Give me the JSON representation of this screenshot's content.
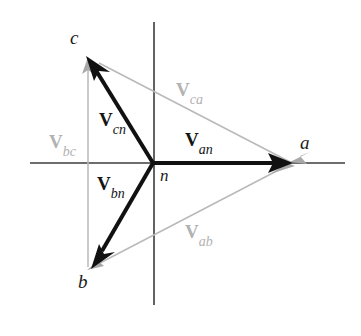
{
  "figure": {
    "width": 361,
    "height": 336,
    "background": "#ffffff"
  },
  "colors": {
    "axis": "#3c3c3c",
    "phase_vector": "#111111",
    "line_vector": "#b2b2b2",
    "vertex_text": "#1a1a1a",
    "faint_text": "#b2b2b2"
  },
  "geometry": {
    "origin": {
      "x": 153,
      "y": 163,
      "label": "n"
    },
    "axes": {
      "horizontal": {
        "x1": 30,
        "y1": 163,
        "x2": 345,
        "y2": 163
      },
      "vertical": {
        "x1": 154,
        "y1": 22,
        "x2": 154,
        "y2": 305
      }
    },
    "vertices": [
      {
        "name": "a",
        "x": 292,
        "y": 163
      },
      {
        "name": "b",
        "x": 92,
        "y": 267
      },
      {
        "name": "c",
        "x": 88,
        "y": 58
      }
    ]
  },
  "vertex_labels": [
    {
      "name": "a",
      "text": "a",
      "x": 300,
      "y": 133
    },
    {
      "name": "b",
      "text": "b",
      "x": 78,
      "y": 272
    },
    {
      "name": "c",
      "text": "c",
      "x": 70,
      "y": 28
    },
    {
      "name": "n",
      "text": "n",
      "x": 160,
      "y": 167
    }
  ],
  "phase_vectors": [
    {
      "name": "V_an",
      "symbol": "V",
      "subscript": "an",
      "from": "n",
      "to": "a",
      "x1": 153,
      "y1": 163,
      "x2": 292,
      "y2": 163,
      "style": "dark",
      "label_x": 185,
      "label_y": 130
    },
    {
      "name": "V_bn",
      "symbol": "V",
      "subscript": "bn",
      "from": "n",
      "to": "b",
      "x1": 153,
      "y1": 163,
      "x2": 92,
      "y2": 267,
      "style": "dark",
      "label_x": 97,
      "label_y": 174
    },
    {
      "name": "V_cn",
      "symbol": "V",
      "subscript": "cn",
      "from": "n",
      "to": "c",
      "x1": 153,
      "y1": 163,
      "x2": 88,
      "y2": 58,
      "style": "dark",
      "label_x": 99,
      "label_y": 110
    }
  ],
  "line_vectors": [
    {
      "name": "V_ab",
      "symbol": "V",
      "subscript": "ab",
      "from": "a",
      "to": "b",
      "x1": 292,
      "y1": 163,
      "x2": 92,
      "y2": 267,
      "style": "faint",
      "label_x": 185,
      "label_y": 222
    },
    {
      "name": "V_bc",
      "symbol": "V",
      "subscript": "bc",
      "from": "b",
      "to": "c",
      "x1": 88,
      "y1": 267,
      "x2": 88,
      "y2": 58,
      "style": "faint",
      "label_x": 49,
      "label_y": 132
    },
    {
      "name": "V_ca",
      "symbol": "V",
      "subscript": "ca",
      "from": "c",
      "to": "a",
      "x1": 88,
      "y1": 58,
      "x2": 292,
      "y2": 163,
      "style": "faint",
      "label_x": 176,
      "label_y": 80
    }
  ]
}
